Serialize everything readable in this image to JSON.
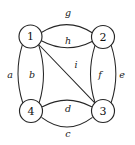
{
  "figure": {
    "width": 135,
    "height": 145,
    "background_color": "#ffffff",
    "stroke_color": "#262626",
    "label_color": "#1a1a1a"
  },
  "nodes": [
    {
      "id": "1",
      "label": "1",
      "cx": 30.5,
      "cy": 36.5,
      "r": 11.5
    },
    {
      "id": "2",
      "label": "2",
      "cx": 103.0,
      "cy": 37.0,
      "r": 11.5
    },
    {
      "id": "3",
      "label": "3",
      "cx": 103.0,
      "cy": 111.0,
      "r": 11.5
    },
    {
      "id": "4",
      "label": "4",
      "cx": 31.0,
      "cy": 111.0,
      "r": 11.5
    }
  ],
  "edges": [
    {
      "id": "g",
      "label": "g",
      "source": "1",
      "target": "2",
      "shape": "arc",
      "side": "outer-top",
      "path": "M 41.4 32.5 Q 67.0 16.5 92.6 33.0",
      "label_x": 68,
      "label_y": 12
    },
    {
      "id": "h",
      "label": "h",
      "source": "1",
      "target": "2",
      "shape": "arc",
      "side": "inner-bottom",
      "path": "M 41.4 40.8 Q 67.0 54.5 92.6 41.3",
      "label_x": 68,
      "label_y": 40
    },
    {
      "id": "a",
      "label": "a",
      "source": "1",
      "target": "4",
      "shape": "arc",
      "side": "outer-left",
      "path": "M 22.3 44.8 Q 13.5 73.5 22.7 102.7",
      "label_x": 10,
      "label_y": 74
    },
    {
      "id": "b",
      "label": "b",
      "source": "1",
      "target": "4",
      "shape": "arc",
      "side": "inner-right",
      "path": "M 38.7 44.8 Q 48.0 73.5 39.2 102.7",
      "label_x": 32,
      "label_y": 74
    },
    {
      "id": "f",
      "label": "f",
      "source": "2",
      "target": "3",
      "shape": "arc",
      "side": "inner-left",
      "path": "M 95.0 45.3 Q 86.0 74.0 95.0 102.7",
      "label_x": 100,
      "label_y": 74
    },
    {
      "id": "e",
      "label": "e",
      "source": "2",
      "target": "3",
      "shape": "arc",
      "side": "outer-right",
      "path": "M 111.2 45.3 Q 120.5 74.0 111.2 102.7",
      "label_x": 122,
      "label_y": 74
    },
    {
      "id": "d",
      "label": "d",
      "source": "4",
      "target": "3",
      "shape": "arc",
      "side": "inner-top",
      "path": "M 42.4 106.8 Q 67.0 93.5 91.6 106.8",
      "label_x": 68,
      "label_y": 108
    },
    {
      "id": "c",
      "label": "c",
      "source": "4",
      "target": "3",
      "shape": "arc",
      "side": "outer-bottom",
      "path": "M 41.9 117.6 Q 67.0 136.5 92.1 117.6",
      "label_x": 68,
      "label_y": 133
    },
    {
      "id": "i",
      "label": "i",
      "source": "1",
      "target": "3",
      "shape": "line",
      "side": "diagonal",
      "path": "M 38.7 44.5 L 95.0 103.2",
      "label_x": 76,
      "label_y": 64
    }
  ]
}
